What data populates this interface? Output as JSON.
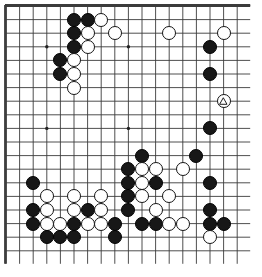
{
  "board": {
    "game": "go",
    "size": 19,
    "visible_columns": 18,
    "visible_rows": 19,
    "line_color": "#3b3b3b",
    "border_color": "#1a1a1a",
    "background_color": "#ffffff",
    "black_color": "#171717",
    "white_color": "#ffffff",
    "grid_spacing": 13.6,
    "origin_x": 6,
    "origin_y": 6,
    "hoshi": [
      {
        "c": 3,
        "r": 3
      },
      {
        "c": 9,
        "r": 3
      },
      {
        "c": 3,
        "r": 9
      },
      {
        "c": 9,
        "r": 9
      }
    ],
    "stones": [
      {
        "c": 5,
        "r": 1,
        "color": "black"
      },
      {
        "c": 6,
        "r": 1,
        "color": "black"
      },
      {
        "c": 7,
        "r": 1,
        "color": "white"
      },
      {
        "c": 5,
        "r": 2,
        "color": "black"
      },
      {
        "c": 6,
        "r": 2,
        "color": "white"
      },
      {
        "c": 8,
        "r": 2,
        "color": "white"
      },
      {
        "c": 12,
        "r": 2,
        "color": "white"
      },
      {
        "c": 16,
        "r": 2,
        "color": "white"
      },
      {
        "c": 5,
        "r": 3,
        "color": "black"
      },
      {
        "c": 6,
        "r": 3,
        "color": "white"
      },
      {
        "c": 15,
        "r": 3,
        "color": "black"
      },
      {
        "c": 4,
        "r": 4,
        "color": "black"
      },
      {
        "c": 5,
        "r": 4,
        "color": "white"
      },
      {
        "c": 4,
        "r": 5,
        "color": "black"
      },
      {
        "c": 5,
        "r": 5,
        "color": "white"
      },
      {
        "c": 15,
        "r": 5,
        "color": "black"
      },
      {
        "c": 5,
        "r": 6,
        "color": "white"
      },
      {
        "c": 16,
        "r": 7,
        "color": "white",
        "mark": "triangle"
      },
      {
        "c": 15,
        "r": 9,
        "color": "black"
      },
      {
        "c": 10,
        "r": 11,
        "color": "black"
      },
      {
        "c": 14,
        "r": 11,
        "color": "black"
      },
      {
        "c": 9,
        "r": 12,
        "color": "black"
      },
      {
        "c": 10,
        "r": 12,
        "color": "white"
      },
      {
        "c": 11,
        "r": 12,
        "color": "white"
      },
      {
        "c": 13,
        "r": 12,
        "color": "white"
      },
      {
        "c": 2,
        "r": 13,
        "color": "black"
      },
      {
        "c": 9,
        "r": 13,
        "color": "black"
      },
      {
        "c": 10,
        "r": 13,
        "color": "white"
      },
      {
        "c": 11,
        "r": 13,
        "color": "black"
      },
      {
        "c": 15,
        "r": 13,
        "color": "black"
      },
      {
        "c": 3,
        "r": 14,
        "color": "white"
      },
      {
        "c": 5,
        "r": 14,
        "color": "white"
      },
      {
        "c": 7,
        "r": 14,
        "color": "white"
      },
      {
        "c": 9,
        "r": 14,
        "color": "black"
      },
      {
        "c": 10,
        "r": 14,
        "color": "white"
      },
      {
        "c": 12,
        "r": 14,
        "color": "white"
      },
      {
        "c": 2,
        "r": 15,
        "color": "black"
      },
      {
        "c": 3,
        "r": 15,
        "color": "white"
      },
      {
        "c": 5,
        "r": 15,
        "color": "white"
      },
      {
        "c": 6,
        "r": 15,
        "color": "black"
      },
      {
        "c": 7,
        "r": 15,
        "color": "white"
      },
      {
        "c": 9,
        "r": 15,
        "color": "black"
      },
      {
        "c": 11,
        "r": 15,
        "color": "white"
      },
      {
        "c": 15,
        "r": 15,
        "color": "black"
      },
      {
        "c": 2,
        "r": 16,
        "color": "black"
      },
      {
        "c": 3,
        "r": 16,
        "color": "white"
      },
      {
        "c": 4,
        "r": 16,
        "color": "white"
      },
      {
        "c": 5,
        "r": 16,
        "color": "black"
      },
      {
        "c": 6,
        "r": 16,
        "color": "white"
      },
      {
        "c": 7,
        "r": 16,
        "color": "white"
      },
      {
        "c": 8,
        "r": 16,
        "color": "black"
      },
      {
        "c": 10,
        "r": 16,
        "color": "black"
      },
      {
        "c": 11,
        "r": 16,
        "color": "black"
      },
      {
        "c": 12,
        "r": 16,
        "color": "white"
      },
      {
        "c": 13,
        "r": 16,
        "color": "white"
      },
      {
        "c": 15,
        "r": 16,
        "color": "black"
      },
      {
        "c": 16,
        "r": 16,
        "color": "black"
      },
      {
        "c": 3,
        "r": 17,
        "color": "black"
      },
      {
        "c": 4,
        "r": 17,
        "color": "black"
      },
      {
        "c": 5,
        "r": 17,
        "color": "black"
      },
      {
        "c": 8,
        "r": 17,
        "color": "black"
      },
      {
        "c": 15,
        "r": 17,
        "color": "white"
      }
    ]
  }
}
